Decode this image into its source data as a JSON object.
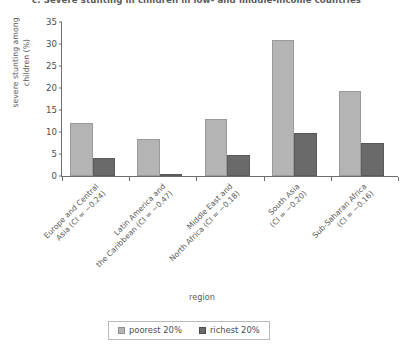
{
  "chart_data": {
    "type": "bar",
    "title": "c. Severe stunting in children in low- and middle-income countries",
    "xlabel": "region",
    "ylabel": "severe stunting among children (%)",
    "ylim": [
      0,
      35
    ],
    "yticks": [
      0,
      5,
      10,
      15,
      20,
      25,
      30,
      35
    ],
    "ytick_labels": [
      "0",
      "5",
      "10",
      "15",
      "20",
      "25",
      "30",
      "35"
    ],
    "grid": false,
    "legend_position": "bottom",
    "categories": [
      "Europe and Central Asia (CI = −0.24)",
      "Latin America and the Caribbean (CI = −0.47)",
      "Middle East and North Africa (CI = −0.18)",
      "South Asia (CI = −0.20)",
      "Sub-Saharan Africa (CI = −0.16)"
    ],
    "category_lines": [
      [
        "Europe and Central",
        "Asia (CI = −0.24)"
      ],
      [
        "Latin America and",
        "the Caribbean (CI = −0.47)"
      ],
      [
        "Middle East and",
        "North Africa (CI = −0.18)"
      ],
      [
        "South Asia",
        "(CI = −0.20)"
      ],
      [
        "Sub-Saharan Africa",
        "(CI = −0.16)"
      ]
    ],
    "series": [
      {
        "name": "poorest 20%",
        "color": "#b4b4b4",
        "values": [
          12.1,
          8.5,
          13.0,
          31.0,
          19.3
        ]
      },
      {
        "name": "richest 20%",
        "color": "#6a6a6a",
        "values": [
          4.0,
          0.4,
          4.8,
          9.7,
          7.5
        ]
      }
    ]
  },
  "legend": {
    "items": [
      {
        "label": "poorest 20%",
        "swatch": "poorest"
      },
      {
        "label": "richest 20%",
        "swatch": "richest"
      }
    ]
  }
}
